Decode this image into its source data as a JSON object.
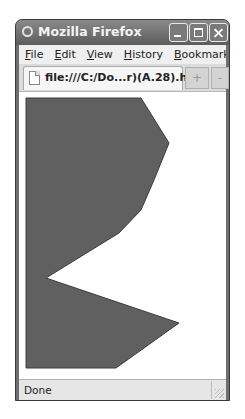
{
  "window": {
    "title": "Mozilla Firefox",
    "controls": {
      "minimize": "minimize",
      "maximize": "maximize",
      "close": "close"
    }
  },
  "menubar": {
    "items": [
      "File",
      "Edit",
      "View",
      "History",
      "Bookmarks",
      "Tools"
    ]
  },
  "tabs": [
    {
      "label": "file:///C:/Do...r)(A.28).html",
      "active": true
    }
  ],
  "tabbar": {
    "new_tab": "+",
    "list_tabs": "-"
  },
  "content": {
    "shape": {
      "type": "polygon",
      "fill": "#606060",
      "stroke": "#3c3c3c",
      "points": "7,6 122,6 150,51 135,88 122,118 100,141 27,186 160,231 97,276 7,276"
    }
  },
  "status": {
    "text": "Done"
  }
}
